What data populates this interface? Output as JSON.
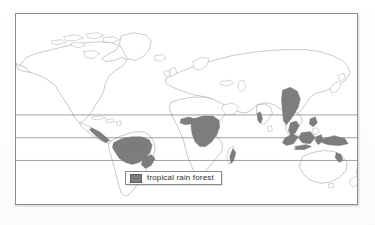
{
  "figure": {
    "type": "world-map",
    "frame": {
      "border_color": "#8e8e8e",
      "background": "#ffffff"
    },
    "background_color": "#fdfdfd"
  },
  "legend": {
    "label": "tropical rain forest",
    "swatch_color": "#7d7d7d",
    "swatch_border_color": "#5f5f5f",
    "box_border_color": "#8a8a8a",
    "box_background": "#ffffff"
  },
  "map": {
    "land_outline_color": "#9a9a9a",
    "land_fill_color": "#ffffff",
    "highlight_fill_color": "#7d7d7d",
    "graticule_color": "#7a7a7a",
    "latitude_lines": [
      {
        "name": "tropic-of-cancer",
        "label": "Tropic of Cancer",
        "y": 115
      },
      {
        "name": "equator",
        "label": "Equator",
        "y": 138
      },
      {
        "name": "tropic-of-capricorn",
        "label": "Tropic of Capricorn",
        "y": 161
      }
    ],
    "landmasses": [
      "north-america",
      "greenland",
      "south-america",
      "africa",
      "europe",
      "asia",
      "australia",
      "new-zealand",
      "madagascar",
      "indonesia",
      "japan",
      "british-isles",
      "antarctic-fringe"
    ],
    "rainforest_regions": [
      "amazon-basin",
      "central-america",
      "west-africa-guinea-coast",
      "congo-basin",
      "madagascar-east-coast",
      "western-ghats-india",
      "indochina-malay-peninsula",
      "sumatra-borneo-java",
      "new-guinea",
      "philippines",
      "northeast-australia-queensland"
    ]
  }
}
